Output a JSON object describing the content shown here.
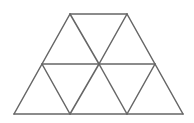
{
  "diagram": {
    "stroke_color": "#666666",
    "background": "#ffffff",
    "vertices": {
      "T1": [
        70,
        14
      ],
      "T2": [
        127,
        14
      ],
      "M1": [
        42,
        64
      ],
      "M2": [
        99,
        64
      ],
      "M3": [
        155,
        64
      ],
      "B1": [
        14,
        114
      ],
      "B2": [
        70,
        114
      ],
      "B3": [
        127,
        114
      ],
      "B4": [
        183,
        114
      ]
    },
    "segments": [
      [
        "T1",
        "T2"
      ],
      [
        "M1",
        "M3"
      ],
      [
        "B1",
        "B4"
      ],
      [
        "T1",
        "B1"
      ],
      [
        "T2",
        "B4"
      ],
      [
        "T1",
        "M2"
      ],
      [
        "M2",
        "B3"
      ],
      [
        "T2",
        "M2"
      ],
      [
        "M2",
        "B2"
      ],
      [
        "M1",
        "B2"
      ],
      [
        "M3",
        "B3"
      ]
    ],
    "triangle_count": 8
  }
}
